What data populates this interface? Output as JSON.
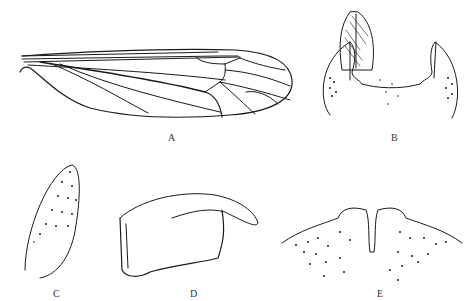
{
  "figure": {
    "panels": [
      {
        "id": "A",
        "label": "A",
        "description": "wing"
      },
      {
        "id": "B",
        "label": "B",
        "description": "genital structure, dorsal view"
      },
      {
        "id": "C",
        "label": "C",
        "description": "lobe"
      },
      {
        "id": "D",
        "label": "D",
        "description": "gonostylus"
      },
      {
        "id": "E",
        "label": "E",
        "description": "tergite margin"
      }
    ],
    "line_color": "#1a1a1a",
    "background": "#ffffff"
  }
}
